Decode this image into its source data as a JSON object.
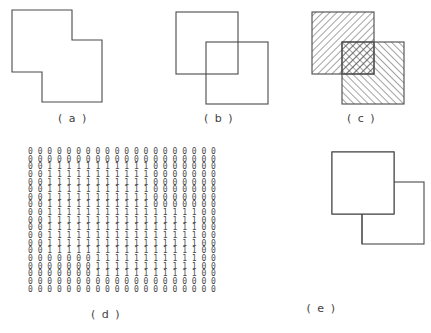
{
  "figure": {
    "stroke_color": "#4a4a4a",
    "background_color": "#ffffff"
  },
  "panels": [
    {
      "id": "a",
      "caption": "( a )",
      "description": "merged-region-outline",
      "kind": "outline"
    },
    {
      "id": "b",
      "caption": "( b )",
      "description": "two-overlapping-square-outlines",
      "kind": "outline"
    },
    {
      "id": "c",
      "caption": "( c )",
      "description": "two-hatched-squares-with-crosshatched-overlap",
      "kind": "hatched"
    },
    {
      "id": "d",
      "caption": "( d )",
      "description": "binary-digit-matrix",
      "kind": "matrix"
    },
    {
      "id": "e",
      "caption": "( e )",
      "description": "rectangle-decomposition-outline",
      "kind": "outline"
    }
  ],
  "chart_data": {
    "type": "heatmap",
    "xlabel": "",
    "ylabel": "",
    "rows": 19,
    "columns": 20,
    "values": [
      "00000000000000000000",
      "00000000000000000000",
      "00111111111110000000",
      "00111111111110000000",
      "00111111111110000000",
      "00111111111110000000",
      "00111111111110000000",
      "00111111111110000000",
      "00111111111111111100",
      "00111111111111111100",
      "00111111111111111100",
      "00111111111111111100",
      "00111111111111111100",
      "00111111111111111100",
      "00000001111111111100",
      "00000001111111111100",
      "00000001111111111100",
      "00000000000000000000",
      "00000000000000000000"
    ]
  },
  "shapes": {
    "panel_a": {
      "polygon_points": "12,10 72,10 72,40 102,40 102,102 42,102 42,72 12,72"
    },
    "panel_b": {
      "square_upper_left": {
        "x": 30,
        "y": 12,
        "size": 62
      },
      "square_lower_right": {
        "x": 60,
        "y": 42,
        "size": 62
      }
    },
    "panel_c": {
      "square_upper_left": {
        "x": 20,
        "y": 12,
        "size": 62
      },
      "square_lower_right": {
        "x": 50,
        "y": 42,
        "size": 62
      },
      "hatch_spacing": 5
    },
    "panel_e": {
      "square_upper_left": {
        "x": 120,
        "y": 12,
        "size": 62
      },
      "square_lower_right": {
        "x": 150,
        "y": 42,
        "size": 62
      }
    }
  }
}
